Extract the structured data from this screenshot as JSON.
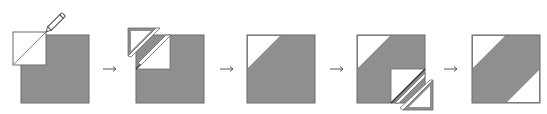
{
  "diagram": {
    "colors": {
      "background": "#ffffff",
      "fabric_gray": "#8f8f8f",
      "outline": "#6a6a6a",
      "white_fabric": "#ffffff",
      "pencil_body": "#ffffff",
      "pencil_outline": "#4a4a4a",
      "arrow": "#555555"
    },
    "steps": [
      {
        "index": 1,
        "description": "Place small white square on upper-left corner of gray square; draw diagonal line with pencil"
      },
      {
        "index": 2,
        "description": "Sew on line, trim excess corner triangle away (seam allowance)"
      },
      {
        "index": 3,
        "description": "Press open: white triangle in upper-left corner"
      },
      {
        "index": 4,
        "description": "Repeat with white square on lower-right corner, sew and trim"
      },
      {
        "index": 5,
        "description": "Finished block: white triangles in upper-left and lower-right corners"
      }
    ],
    "arrows": [
      {
        "from": 1,
        "to": 2
      },
      {
        "from": 2,
        "to": 3
      },
      {
        "from": 3,
        "to": 4
      },
      {
        "from": 4,
        "to": 5
      }
    ]
  }
}
